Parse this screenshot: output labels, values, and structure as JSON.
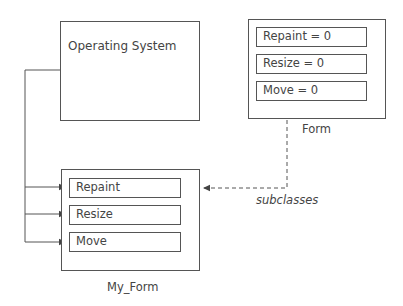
{
  "diagram": {
    "operating_system": {
      "title": "Operating System"
    },
    "form": {
      "label": "Form",
      "fields": [
        "Repaint = 0",
        "Resize = 0",
        "Move = 0"
      ]
    },
    "my_form": {
      "label": "My_Form",
      "fields": [
        "Repaint",
        "Resize",
        "Move"
      ]
    },
    "relationship": {
      "label": "subclasses"
    },
    "colors": {
      "stroke": "#555555",
      "text": "#444444",
      "background": "#ffffff"
    }
  }
}
